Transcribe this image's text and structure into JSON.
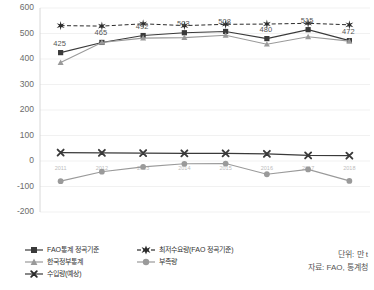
{
  "chart_data": {
    "type": "line",
    "title": "",
    "xlabel": "",
    "ylabel": "",
    "ylim": [
      -200,
      600
    ],
    "yticks": [
      600,
      500,
      400,
      300,
      200,
      100,
      0,
      -100,
      -200
    ],
    "grid": true,
    "legend_position": "bottom",
    "categories": [
      "2011",
      "2012",
      "2013",
      "2014",
      "2015",
      "2016",
      "2017",
      "2018"
    ],
    "series": [
      {
        "name": "FAO통계 정곡기준",
        "key": "fao-milled",
        "marker": "square",
        "color": "#3a3a3a",
        "linestyle": "solid",
        "values": [
          425,
          465,
          492,
          503,
          508,
          480,
          515,
          472
        ],
        "labels": [
          "425",
          "465",
          "492",
          "503",
          "508",
          "480",
          "515",
          "472"
        ]
      },
      {
        "name": "최저수요량(FAO 정곡기준)",
        "key": "min-demand",
        "marker": "star",
        "color": "#2b2b2b",
        "linestyle": "dashed",
        "values": [
          531,
          529,
          538,
          531,
          536,
          537,
          540,
          534
        ],
        "labels": [
          "",
          "",
          "",
          "",
          "",
          "",
          "",
          ""
        ]
      },
      {
        "name": "한국정부통계",
        "key": "korea-gov",
        "marker": "triangle",
        "color": "#9a9a9a",
        "linestyle": "solid",
        "values": [
          386,
          465,
          482,
          484,
          493,
          458,
          487,
          470
        ],
        "labels": [
          "",
          "",
          "",
          "",
          "",
          "",
          "",
          ""
        ]
      },
      {
        "name": "부족량",
        "key": "shortage",
        "marker": "circle",
        "color": "#9a9a9a",
        "linestyle": "solid",
        "values": [
          -79,
          -42,
          -23,
          -11,
          -10,
          -52,
          -33,
          -78
        ],
        "labels": [
          "",
          "",
          "",
          "",
          "",
          "",
          "",
          ""
        ]
      },
      {
        "name": "수입량(예상)",
        "key": "imports",
        "marker": "x",
        "color": "#3a3a3a",
        "linestyle": "solid",
        "values": [
          33,
          32,
          31,
          30,
          30,
          28,
          22,
          21
        ],
        "labels": [
          "",
          "",
          "",
          "",
          "",
          "",
          "",
          ""
        ]
      }
    ]
  },
  "legend": {
    "items": [
      {
        "label": "FAO통계 정곡기준",
        "key": "fao-milled"
      },
      {
        "label": "최저수요량(FAO 정곡기준)",
        "key": "min-demand"
      },
      {
        "label": "한국정부통계",
        "key": "korea-gov"
      },
      {
        "label": "부족량",
        "key": "shortage"
      },
      {
        "label": "수입량(예상)",
        "key": "imports"
      }
    ]
  },
  "notes": {
    "unit": "단위: 만 t",
    "source": "자료: FAO, 통계청"
  }
}
